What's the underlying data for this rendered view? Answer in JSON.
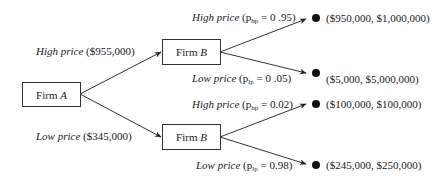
{
  "nodes": {
    "root": {
      "name": "Firm",
      "player": "A"
    },
    "upper": {
      "name": "Firm",
      "player": "B"
    },
    "lower": {
      "name": "Firm",
      "player": "B"
    }
  },
  "firm_a_moves": [
    {
      "label": "High price",
      "value": "($955,000)"
    },
    {
      "label": "Low price",
      "value": "($345,000)"
    }
  ],
  "firm_b_moves": [
    {
      "label": "High price",
      "prob_symbol": "p",
      "prob_sub": "hp",
      "prob_value": "= 0 .95)",
      "open": "("
    },
    {
      "label": "Low price",
      "prob_symbol": "p",
      "prob_sub": "lp",
      "prob_value": "= 0 .05)",
      "open": "("
    },
    {
      "label": "High price",
      "prob_symbol": "p",
      "prob_sub": "hp",
      "prob_value": "= 0.02)",
      "open": "("
    },
    {
      "label": "Low price",
      "prob_symbol": "p",
      "prob_sub": "lp",
      "prob_value": "= 0.98)",
      "open": "("
    }
  ],
  "payoffs": [
    "($950,000, $1,000,000)",
    "($5,000, $5,000,000)",
    "($100,000, $100,000)",
    "($245,000, $250,000)"
  ]
}
